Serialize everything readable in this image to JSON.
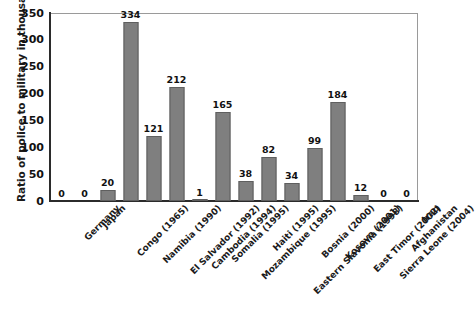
{
  "chart_data": {
    "type": "bar",
    "title": "",
    "xlabel": "",
    "ylabel": "Ratio of police to military in thousands",
    "ylim": [
      0,
      350
    ],
    "yticks": [
      0,
      50,
      100,
      150,
      200,
      250,
      300,
      350
    ],
    "ytick_labels": [
      "0",
      "50",
      "100",
      "150",
      "200",
      "250",
      "300",
      "350"
    ],
    "grid": false,
    "legend": "none",
    "bar_color": "#7f7f7f",
    "bar_edge_color": "#5f5f5f",
    "show_value_labels": true,
    "xtick_rotation": -45,
    "categories": [
      "Germany",
      "Japan",
      "Congo (1965)",
      "Namibia (1990)",
      "El Salvador (1992)",
      "Cambodia (1994)",
      "Somalia (1995)",
      "Mozambique (1995)",
      "Haiti (1995)",
      "Eastern Slavonia (1998)",
      "Bosnia (2000)",
      "Kosovo (2001)",
      "East Timor (2002)",
      "Sierra Leone (2004)",
      "Afghanistan",
      "Iraq"
    ],
    "values": [
      0,
      0,
      20,
      334,
      121,
      212,
      1,
      165,
      38,
      82,
      34,
      99,
      184,
      12,
      0,
      0
    ],
    "value_labels": [
      "0",
      "0",
      "20",
      "334",
      "121",
      "212",
      "1",
      "165",
      "38",
      "82",
      "34",
      "99",
      "184",
      "12",
      "0",
      "0"
    ]
  }
}
